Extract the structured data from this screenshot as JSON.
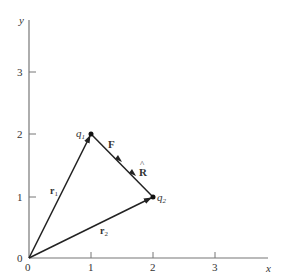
{
  "diagram": {
    "axes": {
      "x_label": "x",
      "y_label": "y",
      "x_ticks": [
        "0",
        "1",
        "2",
        "3"
      ],
      "y_ticks": [
        "0",
        "1",
        "2",
        "3"
      ]
    },
    "points": {
      "q1": {
        "label": "q",
        "subscript": "1",
        "x": 1,
        "y": 2
      },
      "q2": {
        "label": "q",
        "subscript": "2",
        "x": 2,
        "y": 1
      }
    },
    "vectors": {
      "r1": {
        "label": "r",
        "subscript": "1",
        "from": [
          0,
          0
        ],
        "to": [
          1,
          2
        ]
      },
      "r2": {
        "label": "r",
        "subscript": "2",
        "from": [
          0,
          0
        ],
        "to": [
          2,
          1
        ]
      },
      "F": {
        "label": "F"
      },
      "R_hat": {
        "label": "R",
        "accent": "^"
      }
    },
    "colors": {
      "line": "#222222",
      "axis": "#777777",
      "text": "#333333"
    }
  }
}
